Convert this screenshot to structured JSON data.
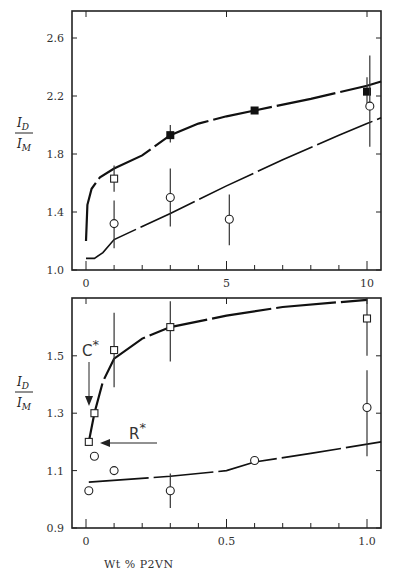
{
  "chart_data": [
    {
      "type": "scatter",
      "panel": "top",
      "title": "",
      "xlabel": "",
      "ylabel": "I_D / I_M",
      "xlim": [
        -0.8,
        10.5
      ],
      "ylim": [
        1.0,
        2.75
      ],
      "x_ticks": [
        0,
        5,
        10
      ],
      "x_minor_ticks": [
        1,
        2,
        3,
        4,
        6,
        7,
        8,
        9
      ],
      "y_ticks": [
        1.0,
        1.4,
        1.8,
        2.2,
        2.6
      ],
      "grid": false,
      "series": [
        {
          "name": "filled squares",
          "marker": "filled-square",
          "points": [
            {
              "x": 3,
              "y": 1.93,
              "err": [
                1.88,
                2.0
              ]
            },
            {
              "x": 6,
              "y": 2.1,
              "err": null
            },
            {
              "x": 10,
              "y": 2.23,
              "err": [
                2.12,
                2.33
              ]
            }
          ]
        },
        {
          "name": "open squares",
          "marker": "open-square",
          "points": [
            {
              "x": 1,
              "y": 1.63,
              "err": [
                1.54,
                1.72
              ]
            }
          ]
        },
        {
          "name": "open circles",
          "marker": "open-circle",
          "points": [
            {
              "x": 1,
              "y": 1.32,
              "err": [
                1.15,
                1.48
              ]
            },
            {
              "x": 3,
              "y": 1.5,
              "err": [
                1.3,
                1.7
              ]
            },
            {
              "x": 5.1,
              "y": 1.35,
              "err": [
                1.17,
                1.52
              ]
            },
            {
              "x": 10.1,
              "y": 2.13,
              "err": [
                1.85,
                2.48
              ]
            }
          ]
        }
      ],
      "curves": [
        {
          "name": "upper fit",
          "points": [
            [
              0,
              1.2
            ],
            [
              0.05,
              1.45
            ],
            [
              0.2,
              1.56
            ],
            [
              0.5,
              1.64
            ],
            [
              1,
              1.7
            ],
            [
              2,
              1.79
            ],
            [
              3,
              1.93
            ],
            [
              4,
              2.01
            ],
            [
              5,
              2.06
            ],
            [
              6,
              2.1
            ],
            [
              8,
              2.18
            ],
            [
              10,
              2.27
            ],
            [
              10.5,
              2.3
            ]
          ]
        },
        {
          "name": "lower fit",
          "points": [
            [
              0,
              1.08
            ],
            [
              0.3,
              1.08
            ],
            [
              0.6,
              1.12
            ],
            [
              1,
              1.21
            ],
            [
              2,
              1.3
            ],
            [
              3,
              1.39
            ],
            [
              5,
              1.58
            ],
            [
              7,
              1.76
            ],
            [
              9,
              1.93
            ],
            [
              10,
              2.01
            ],
            [
              10.5,
              2.05
            ]
          ]
        }
      ]
    },
    {
      "type": "scatter",
      "panel": "bottom",
      "title": "",
      "xlabel": "Wt % P2VN",
      "ylabel": "I_D / I_M",
      "xlim": [
        -0.08,
        1.05
      ],
      "ylim": [
        0.9,
        1.7
      ],
      "x_ticks": [
        0,
        0.5,
        1.0
      ],
      "x_minor_ticks": [
        0.1,
        0.2,
        0.3,
        0.4,
        0.6,
        0.7,
        0.8,
        0.9
      ],
      "y_ticks": [
        0.9,
        1.1,
        1.3,
        1.5
      ],
      "grid": false,
      "series": [
        {
          "name": "open squares",
          "marker": "open-square",
          "points": [
            {
              "x": 0.01,
              "y": 1.2,
              "err": null
            },
            {
              "x": 0.03,
              "y": 1.3,
              "err": null
            },
            {
              "x": 0.1,
              "y": 1.52,
              "err": [
                1.39,
                1.65
              ]
            },
            {
              "x": 0.3,
              "y": 1.6,
              "err": [
                1.48,
                1.69
              ]
            },
            {
              "x": 1.0,
              "y": 1.63,
              "err": [
                1.5,
                1.7
              ]
            }
          ]
        },
        {
          "name": "open circles",
          "marker": "open-circle",
          "points": [
            {
              "x": 0.01,
              "y": 1.03,
              "err": null
            },
            {
              "x": 0.03,
              "y": 1.15,
              "err": null
            },
            {
              "x": 0.1,
              "y": 1.1,
              "err": null
            },
            {
              "x": 0.3,
              "y": 1.03,
              "err": [
                0.97,
                1.09
              ]
            },
            {
              "x": 0.6,
              "y": 1.135,
              "err": null
            },
            {
              "x": 1.0,
              "y": 1.32,
              "err": [
                1.15,
                1.45
              ]
            }
          ]
        }
      ],
      "curves": [
        {
          "name": "upper fit",
          "points": [
            [
              0.01,
              1.2
            ],
            [
              0.03,
              1.3
            ],
            [
              0.06,
              1.41
            ],
            [
              0.1,
              1.49
            ],
            [
              0.2,
              1.56
            ],
            [
              0.3,
              1.6
            ],
            [
              0.5,
              1.64
            ],
            [
              0.7,
              1.67
            ],
            [
              1.0,
              1.695
            ]
          ]
        },
        {
          "name": "lower fit",
          "points": [
            [
              0.01,
              1.06
            ],
            [
              0.3,
              1.08
            ],
            [
              0.5,
              1.1
            ],
            [
              0.6,
              1.13
            ],
            [
              0.8,
              1.16
            ],
            [
              1.05,
              1.2
            ]
          ]
        }
      ],
      "annotations": [
        {
          "text": "C*",
          "x": 0.01,
          "y": 1.47,
          "arrow_to": [
            0.01,
            1.35
          ],
          "arrow_dir": "down"
        },
        {
          "text": "R*",
          "x": 0.2,
          "y": 1.25,
          "arrow_to": [
            0.02,
            1.2
          ],
          "arrow_dir": "left"
        }
      ]
    }
  ],
  "labels": {
    "ylabel_num": "I",
    "ylabel_num_sub": "D",
    "ylabel_den": "I",
    "ylabel_den_sub": "M",
    "xlabel": "Wt % P2VN",
    "annot_c": "C",
    "annot_r": "R",
    "star": "*"
  }
}
